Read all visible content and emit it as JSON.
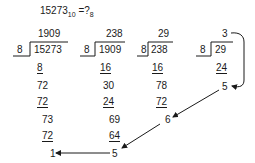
{
  "title": {
    "number": "15273",
    "from_base": "10",
    "equals": "=",
    "question": "?",
    "to_base": "8"
  },
  "divisor": "8",
  "divisions": [
    {
      "quotient": "1909",
      "dividend": "15273",
      "steps": [
        "8",
        "72",
        "72",
        "73",
        "72"
      ],
      "remainder": "1"
    },
    {
      "quotient": "238",
      "dividend": "1909",
      "steps": [
        "16",
        "30",
        "24",
        "69",
        "64"
      ],
      "remainder": "5"
    },
    {
      "quotient": "29",
      "dividend": "238",
      "steps": [
        "16",
        "78",
        "72"
      ],
      "remainder": "6"
    },
    {
      "quotient": "3",
      "dividend": "29",
      "steps": [
        "24"
      ],
      "remainder": "5"
    }
  ],
  "final_quotient": "3",
  "result_digits_order": [
    "3",
    "5",
    "6",
    "5",
    "1"
  ],
  "colors": {
    "ink": "#1a1a1a",
    "background": "#ffffff"
  }
}
